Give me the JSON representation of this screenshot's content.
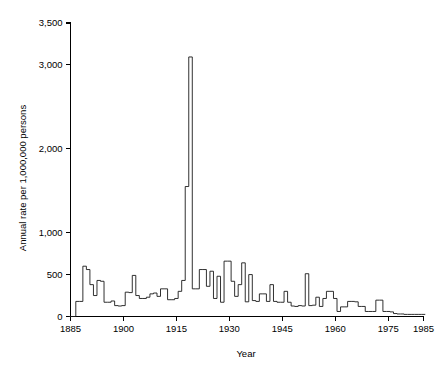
{
  "chart_data": {
    "type": "line",
    "subtype": "step-histogram",
    "title": "",
    "xlabel": "Year",
    "ylabel": "Annual rate per 1,000,000 persons",
    "xlim": [
      1885,
      1985
    ],
    "ylim": [
      0,
      3500
    ],
    "grid": false,
    "legend": null,
    "legend_position": "none",
    "line_color": "#1a1a1a",
    "background_color": "#ffffff",
    "xticks": [
      1885,
      1900,
      1915,
      1930,
      1945,
      1960,
      1975,
      1985
    ],
    "xticklabels": [
      "1885",
      "1900",
      "1915",
      "1930",
      "1945",
      "1960",
      "1975",
      "1985"
    ],
    "yticks": [
      0,
      500,
      1000,
      2000,
      3000,
      3500
    ],
    "yticklabels": [
      "0",
      "500",
      "1,000",
      "2,000",
      "3,000",
      "3,500"
    ],
    "annotations": [
      {
        "text": "peak epidemic year",
        "x": 1919,
        "y": 3095,
        "visible": false
      }
    ],
    "x": [
      1885,
      1886,
      1887,
      1888,
      1889,
      1890,
      1891,
      1892,
      1893,
      1894,
      1895,
      1896,
      1897,
      1898,
      1899,
      1900,
      1901,
      1902,
      1903,
      1904,
      1905,
      1906,
      1907,
      1908,
      1909,
      1910,
      1911,
      1912,
      1913,
      1914,
      1915,
      1916,
      1917,
      1918,
      1919,
      1920,
      1921,
      1922,
      1923,
      1924,
      1925,
      1926,
      1927,
      1928,
      1929,
      1930,
      1931,
      1932,
      1933,
      1934,
      1935,
      1936,
      1937,
      1938,
      1939,
      1940,
      1941,
      1942,
      1943,
      1944,
      1945,
      1946,
      1947,
      1948,
      1949,
      1950,
      1951,
      1952,
      1953,
      1954,
      1955,
      1956,
      1957,
      1958,
      1959,
      1960,
      1961,
      1962,
      1963,
      1964,
      1965,
      1966,
      1967,
      1968,
      1969,
      1970,
      1971,
      1972,
      1973,
      1974,
      1975,
      1976,
      1977,
      1978,
      1979,
      1980,
      1981,
      1982,
      1983,
      1984,
      1985
    ],
    "values": [
      0,
      0,
      180,
      180,
      600,
      560,
      380,
      250,
      430,
      420,
      170,
      170,
      185,
      130,
      125,
      130,
      290,
      285,
      490,
      250,
      215,
      215,
      230,
      270,
      280,
      240,
      330,
      330,
      200,
      200,
      215,
      300,
      430,
      1550,
      3095,
      330,
      330,
      560,
      560,
      360,
      540,
      215,
      480,
      170,
      660,
      660,
      420,
      240,
      380,
      640,
      175,
      500,
      190,
      180,
      270,
      270,
      180,
      380,
      180,
      170,
      170,
      300,
      170,
      125,
      120,
      130,
      125,
      510,
      130,
      135,
      230,
      120,
      215,
      300,
      300,
      215,
      60,
      115,
      115,
      180,
      180,
      175,
      120,
      120,
      60,
      60,
      60,
      195,
      195,
      60,
      60,
      55,
      35,
      30,
      30,
      25,
      25,
      25,
      25,
      25,
      25
    ]
  },
  "axes": {
    "y_axis_title": "Annual rate per 1,000,000 persons",
    "x_axis_title": "Year"
  }
}
